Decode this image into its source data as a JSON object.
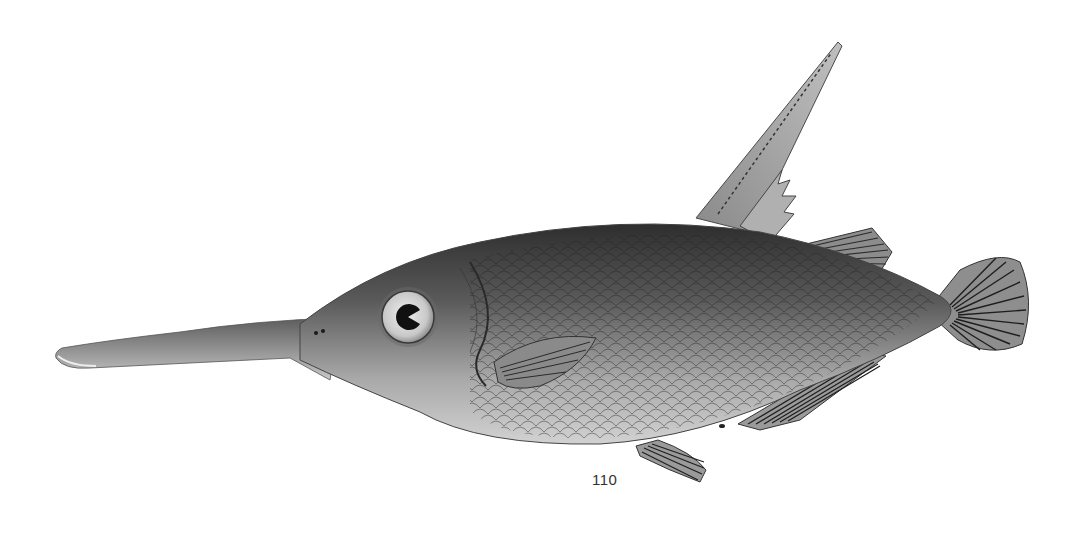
{
  "illustration": {
    "subject": "snipefish",
    "style": "grayscale engraving",
    "colors": {
      "background": "#ffffff",
      "body_dark": "#3a3a3a",
      "body_mid": "#7a7a7a",
      "body_light": "#c9c9c9",
      "fin": "#9a9a9a",
      "fin_ray": "#2a2a2a"
    }
  },
  "page": {
    "number": "110"
  }
}
